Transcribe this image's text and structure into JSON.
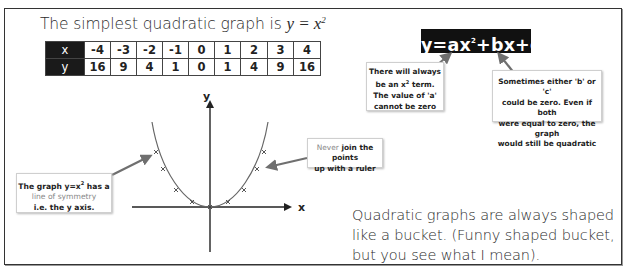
{
  "title": {
    "text": "The simplest quadratic graph is ",
    "math": "y = x",
    "sup": "2"
  },
  "table": {
    "row_headers": [
      "x",
      "y"
    ],
    "x_values": [
      "-4",
      "-3",
      "-2",
      "-1",
      "0",
      "1",
      "2",
      "3",
      "4"
    ],
    "y_values": [
      "16",
      "9",
      "4",
      "1",
      "0",
      "1",
      "4",
      "9",
      "16"
    ]
  },
  "formula": {
    "part1": "y=ax",
    "sup": "2",
    "part2": "+bx+c"
  },
  "notes": {
    "a_term": {
      "line1": "There will always",
      "line2a": "be an x",
      "line2sup": "2",
      "line2b": " term.",
      "line3": "The value of 'a'",
      "line4": "cannot be zero"
    },
    "b_c_zero": {
      "line1": "Sometimes either 'b' or 'c'",
      "line2": "could be zero. Even if both",
      "line3": "were equal to zero, the graph",
      "line4": "would still be quadratic"
    },
    "ruler": {
      "grey": "Never",
      "line1_rest": " join the points",
      "line2": "up with a ruler"
    },
    "symmetry": {
      "line1a": "The graph y=x",
      "line1sup": "2",
      "line1b": " has a",
      "line2": "line of symmetry",
      "line3": "i.e. the y axis."
    }
  },
  "graph": {
    "x_axis_label": "x",
    "y_axis_label": "y",
    "curve_color": "#666666",
    "arrow_color": "#6f6f6f"
  },
  "bucket_text": {
    "line1": "Quadratic graphs are always shaped",
    "line2": "like a bucket. (Funny shaped bucket,",
    "line3": "but you see what I mean)."
  },
  "colors": {
    "formula_bg": "#111111",
    "table_header_bg": "#1a1a1a",
    "border": "#333333"
  }
}
